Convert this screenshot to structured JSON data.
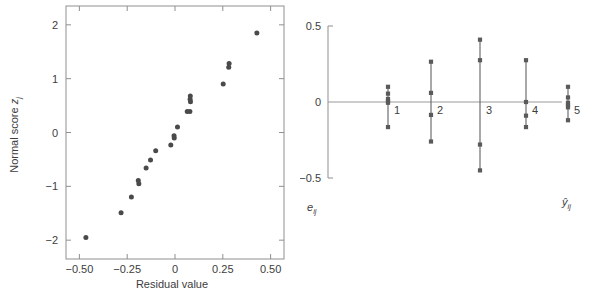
{
  "figure": {
    "panels": [
      "normal-probability-plot",
      "residuals-vs-fitted-plot"
    ],
    "background_color": "#ffffff",
    "marker_color": "#4a4a4a",
    "axis_color": "#8f8f8f"
  },
  "chart_data": [
    {
      "type": "scatter",
      "id": "normal-probability-plot",
      "title": "",
      "xlabel": "Residual value",
      "ylabel": "Normal score z_j",
      "ylabel_main": "Normal score ",
      "ylabel_var": "z",
      "ylabel_sub": "j",
      "xlim": [
        -0.57,
        0.57
      ],
      "ylim": [
        -2.35,
        2.35
      ],
      "xticks": [
        -0.5,
        -0.25,
        0,
        0.25,
        0.5
      ],
      "xticklabels": [
        "−0.50",
        "−0.25",
        "0",
        "0.25",
        "0.50"
      ],
      "yticks": [
        -2,
        -1,
        0,
        1,
        2
      ],
      "yticklabels": [
        "−2",
        "−1",
        "0",
        "1",
        "2"
      ],
      "grid": false,
      "legend": "none",
      "points": [
        {
          "x": -0.466,
          "y": -1.95
        },
        {
          "x": -0.282,
          "y": -1.49
        },
        {
          "x": -0.228,
          "y": -1.2
        },
        {
          "x": -0.192,
          "y": -0.89
        },
        {
          "x": -0.189,
          "y": -0.95
        },
        {
          "x": -0.151,
          "y": -0.66
        },
        {
          "x": -0.128,
          "y": -0.51
        },
        {
          "x": -0.101,
          "y": -0.34
        },
        {
          "x": -0.022,
          "y": -0.23
        },
        {
          "x": -0.005,
          "y": -0.06
        },
        {
          "x": -0.004,
          "y": -0.1
        },
        {
          "x": 0.013,
          "y": 0.1
        },
        {
          "x": 0.064,
          "y": 0.39
        },
        {
          "x": 0.078,
          "y": 0.39
        },
        {
          "x": 0.079,
          "y": 0.62
        },
        {
          "x": 0.08,
          "y": 0.68
        },
        {
          "x": 0.081,
          "y": 0.57
        },
        {
          "x": 0.252,
          "y": 0.9
        },
        {
          "x": 0.281,
          "y": 1.21
        },
        {
          "x": 0.283,
          "y": 1.28
        },
        {
          "x": 0.428,
          "y": 1.85
        }
      ]
    },
    {
      "type": "scatter",
      "id": "residuals-vs-fitted-plot",
      "title": "",
      "xlabel": "ŷ_ij",
      "xlabel_var": "ŷ",
      "xlabel_sub": "ij",
      "ylabel": "e_ij",
      "ylabel_var": "e",
      "ylabel_sub": "ij",
      "ylim": [
        -0.5,
        0.5
      ],
      "yticks": [
        -0.5,
        0,
        0.5
      ],
      "yticklabels": [
        "−0.5",
        "0",
        "0.5"
      ],
      "xticks": [],
      "grid": false,
      "legend": "none",
      "group_labels": [
        "1",
        "2",
        "3",
        "4",
        "5"
      ],
      "groups": [
        {
          "label": "1",
          "x_index": 1,
          "values": [
            0.1,
            0.055,
            0.02,
            0.005,
            -0.005,
            -0.165
          ]
        },
        {
          "label": "2",
          "x_index": 2,
          "values": [
            0.265,
            0.06,
            -0.085,
            -0.26
          ]
        },
        {
          "label": "3",
          "x_index": 3,
          "values": [
            0.41,
            0.275,
            -0.28,
            -0.45
          ]
        },
        {
          "label": "4",
          "x_index": 4,
          "values": [
            0.275,
            0.0,
            -0.09,
            -0.165
          ]
        },
        {
          "label": "5",
          "x_index": 5,
          "values": [
            0.1,
            0.03,
            -0.005,
            -0.02,
            -0.035,
            -0.12
          ]
        }
      ]
    }
  ]
}
